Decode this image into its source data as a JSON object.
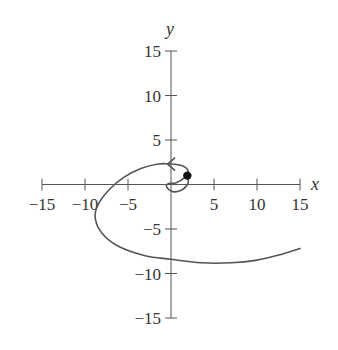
{
  "chart_data": {
    "type": "line",
    "title": "",
    "xlabel": "x",
    "ylabel": "y",
    "xlim": [
      -15,
      15
    ],
    "ylim": [
      -15,
      15
    ],
    "grid": false,
    "legend": null,
    "x_ticks": [
      -15,
      -10,
      -5,
      5,
      10,
      15
    ],
    "y_ticks": [
      15,
      10,
      5,
      -5,
      -10,
      -15
    ],
    "x_tick_labels": [
      "−15",
      "−10",
      "−5",
      "5",
      "10",
      "15"
    ],
    "y_tick_labels": [
      "15",
      "10",
      "5",
      "−5",
      "−10",
      "−15"
    ],
    "series": [
      {
        "name": "parametric spiral curve",
        "description": "Spiral starting at the marked point near (2, 1), curling around the origin, then arcing counter-clockwise through the upper-left, down through the third quadrant and out to the right",
        "points": [
          [
            1.9,
            1.0
          ],
          [
            2.0,
            0.2
          ],
          [
            1.3,
            -0.6
          ],
          [
            0.2,
            -0.8
          ],
          [
            -0.5,
            -0.3
          ],
          [
            -0.3,
            0.1
          ],
          [
            0.6,
            0.2
          ],
          [
            1.6,
            0.8
          ],
          [
            2.0,
            1.5
          ],
          [
            1.3,
            2.1
          ],
          [
            0.0,
            2.3
          ],
          [
            -1.5,
            2.3
          ],
          [
            -3.5,
            1.8
          ],
          [
            -5.5,
            0.8
          ],
          [
            -7.2,
            -0.6
          ],
          [
            -8.5,
            -2.3
          ],
          [
            -8.8,
            -3.8
          ],
          [
            -8.0,
            -5.5
          ],
          [
            -6.0,
            -7.0
          ],
          [
            -3.0,
            -8.0
          ],
          [
            0.0,
            -8.4
          ],
          [
            3.5,
            -8.8
          ],
          [
            7.0,
            -8.8
          ],
          [
            10.0,
            -8.5
          ],
          [
            13.0,
            -7.8
          ],
          [
            15.0,
            -7.2
          ]
        ]
      }
    ],
    "markers": [
      {
        "label": "start point",
        "x": 1.9,
        "y": 1.0,
        "style": "filled-circle"
      }
    ],
    "annotations": [
      {
        "type": "direction-arrow",
        "x": -0.4,
        "y": 2.3,
        "direction": "left"
      }
    ]
  }
}
